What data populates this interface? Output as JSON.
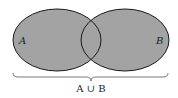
{
  "diagram": {
    "type": "venn",
    "sets": [
      {
        "name": "A",
        "label": "A"
      },
      {
        "name": "B",
        "label": "B"
      }
    ],
    "shaded_region": "A ∪ B",
    "brace_label": "A ∪ B",
    "colors": {
      "fill": "#a3a3a3",
      "stroke": "#1a1a1a",
      "background": "#ffffff"
    }
  }
}
